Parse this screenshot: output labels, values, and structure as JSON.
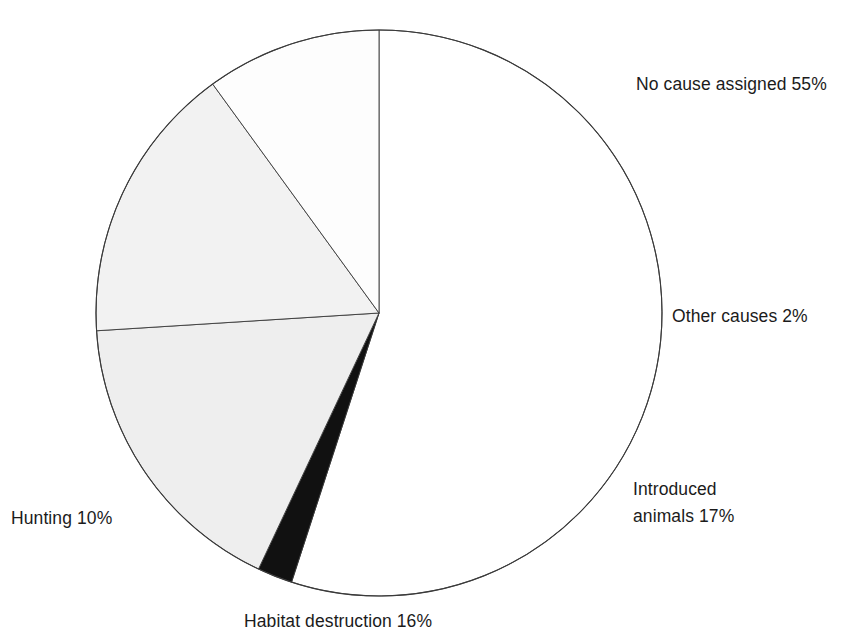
{
  "figure": {
    "title_fragment": "Causes of recorded animal extinctions",
    "background_color": "#ffffff",
    "stroke_color": "#3a3a3a"
  },
  "labels": {
    "no_cause": "No cause assigned 55%",
    "other_causes": "Other causes 2%",
    "introduced_line1": "Introduced",
    "introduced_line2": "animals 17%",
    "hunting": "Hunting 10%",
    "habitat": "Habitat destruction 16%"
  },
  "chart_data": {
    "type": "pie",
    "title": "Causes of recorded animal extinctions",
    "subtitle": "",
    "xlabel": "",
    "ylabel": "",
    "grid": false,
    "legend": "none",
    "value_unit": "%",
    "total": 100,
    "start_angle_deg": -90,
    "direction": "clockwise",
    "center": {
      "x": 379,
      "y": 313
    },
    "radius": 283,
    "categories": [
      "No cause assigned",
      "Other causes",
      "Introduced animals",
      "Habitat destruction",
      "Hunting"
    ],
    "values": [
      55,
      2,
      17,
      16,
      10
    ],
    "slices": [
      {
        "name": "No cause assigned",
        "value": 55,
        "label": "No cause assigned 55%",
        "fill": "#ffffff",
        "sweep_deg": 198.0,
        "start_deg": -90.0,
        "end_deg": 108.0
      },
      {
        "name": "Other causes",
        "value": 2,
        "label": "Other causes 2%",
        "fill": "#111111",
        "sweep_deg": 7.2,
        "start_deg": 108.0,
        "end_deg": 115.2
      },
      {
        "name": "Introduced animals",
        "value": 17,
        "label": "Introduced animals 17%",
        "fill": "#eeeeee",
        "sweep_deg": 61.2,
        "start_deg": 115.2,
        "end_deg": 176.4
      },
      {
        "name": "Habitat destruction",
        "value": 16,
        "label": "Habitat destruction 16%",
        "fill": "#f2f2f2",
        "sweep_deg": 57.6,
        "start_deg": 176.4,
        "end_deg": 234.0
      },
      {
        "name": "Hunting",
        "value": 10,
        "label": "Hunting 10%",
        "fill": "#fdfdfd",
        "sweep_deg": 36.0,
        "start_deg": 234.0,
        "end_deg": 270.0
      }
    ]
  }
}
